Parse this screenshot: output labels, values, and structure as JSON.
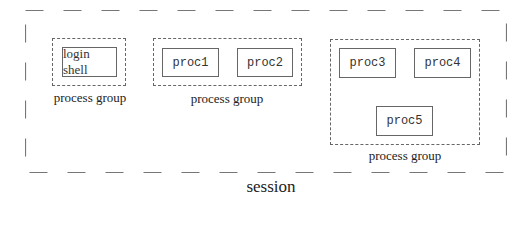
{
  "diagram": {
    "session_label": "session",
    "groups": [
      {
        "label": "process group",
        "processes": [
          "login shell"
        ]
      },
      {
        "label": "process group",
        "processes": [
          "proc1",
          "proc2"
        ]
      },
      {
        "label": "process group",
        "processes": [
          "proc3",
          "proc4",
          "proc5"
        ]
      }
    ],
    "colors": {
      "line": "#666666",
      "text": "#222222",
      "background": "#ffffff"
    }
  }
}
